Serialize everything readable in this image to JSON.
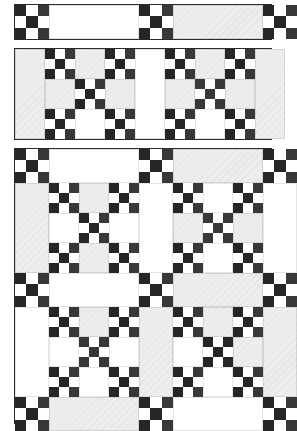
{
  "document": {
    "title": "Nine-Patch Sashing Quilt Assembly Diagram",
    "description": "Three-stage quilt construction diagram: sashing strip row, two-block row, and completed four-block quilt top",
    "background_color": "#ffffff",
    "line_color": "#2a2a2a"
  },
  "palette": {
    "dark": "#262626",
    "dark_secondary": "#383838",
    "white": "#ffffff",
    "light_gray": "#ededed",
    "light_gray_alt": "#f4f4f4",
    "border": "#2a2a2a"
  },
  "legend": {
    "nine_patch": "nine-patch block",
    "sashing": "sashing strip",
    "cornerstone": "nine-patch cornerstone",
    "plain_square": "plain square"
  },
  "panels": [
    {
      "id": "panel-sashing-row",
      "name": "Sashing strip row",
      "x": 14,
      "y": 4,
      "width": 258,
      "height": 36,
      "description": "Horizontal sashing row: cornerstone, sashing, cornerstone, sashing, cornerstone",
      "units": [
        {
          "type": "cornerstone",
          "x": 0,
          "y": 0,
          "width": 34,
          "height": 34
        },
        {
          "type": "sashing",
          "x": 34,
          "y": 0,
          "width": 90,
          "height": 34,
          "fill": "white"
        },
        {
          "type": "cornerstone",
          "x": 124,
          "y": 0,
          "width": 34,
          "height": 34
        },
        {
          "type": "sashing",
          "x": 158,
          "y": 0,
          "width": 90,
          "height": 34,
          "fill": "light_gray"
        },
        {
          "type": "cornerstone",
          "x": 248,
          "y": 0,
          "width": 34,
          "height": 34
        }
      ]
    },
    {
      "id": "panel-block-row",
      "name": "Two-block row with side sashing",
      "x": 14,
      "y": 48,
      "width": 258,
      "height": 92,
      "description": "Row containing side sashing, star block, center sashing, star block, side sashing",
      "units": [
        {
          "type": "sashing-vertical",
          "x": 0,
          "y": 0,
          "width": 30,
          "height": 90,
          "fill": "light_gray"
        },
        {
          "type": "star-block",
          "x": 30,
          "y": 0,
          "width": 90,
          "height": 90,
          "variant": "gray-top-bottom"
        },
        {
          "type": "sashing-vertical",
          "x": 120,
          "y": 0,
          "width": 30,
          "height": 90,
          "fill": "light_gray"
        },
        {
          "type": "star-block",
          "x": 150,
          "y": 0,
          "width": 90,
          "height": 90,
          "variant": "gray-top-bottom"
        },
        {
          "type": "sashing-vertical",
          "x": 240,
          "y": 0,
          "width": 30,
          "height": 90,
          "fill": "light_gray"
        }
      ]
    },
    {
      "id": "panel-quilt-top",
      "name": "Completed quilt top",
      "x": 14,
      "y": 148,
      "width": 258,
      "height": 276,
      "description": "Four star blocks joined with sashing strips and nine-patch cornerstones",
      "grid": {
        "columns": [
          34,
          90,
          34,
          90,
          34
        ],
        "rows": [
          34,
          90,
          34,
          90,
          34
        ]
      },
      "sashing_fills": [
        [
          "cornerstone",
          "white",
          "cornerstone",
          "light_gray",
          "cornerstone"
        ],
        [
          "light_gray",
          "block",
          "white",
          "block",
          "white"
        ],
        [
          "cornerstone",
          "white",
          "cornerstone",
          "light_gray",
          "cornerstone"
        ],
        [
          "white",
          "block",
          "light_gray",
          "block",
          "light_gray"
        ],
        [
          "cornerstone",
          "light_gray",
          "cornerstone",
          "white",
          "cornerstone"
        ]
      ],
      "blocks": [
        {
          "row": 1,
          "col": 1,
          "variant": "gray-top-bottom"
        },
        {
          "row": 1,
          "col": 3,
          "variant": "gray-left-right"
        },
        {
          "row": 3,
          "col": 1,
          "variant": "gray-top"
        },
        {
          "row": 3,
          "col": 3,
          "variant": "gray-top-right"
        }
      ]
    }
  ]
}
